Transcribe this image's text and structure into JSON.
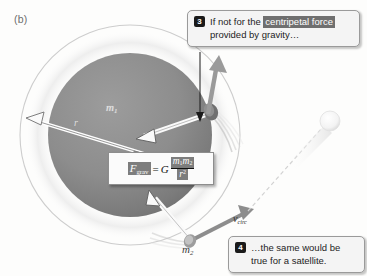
{
  "figure": {
    "panel_label": "(b)",
    "background_color": "#fdfdfc"
  },
  "callouts": [
    {
      "number": "3",
      "text_before": "If not for the ",
      "highlight": "centripetal force",
      "text_after": "provided by gravity…",
      "badge_color": "#1a1a1a",
      "highlight_color": "#6f6f6f"
    },
    {
      "number": "4",
      "text": "…the same would be true for a satellite.",
      "badge_color": "#1a1a1a"
    }
  ],
  "formula": {
    "lhs": "F",
    "lhs_sub": "grav",
    "equals": "=",
    "constant": "G",
    "numerator_m1": "m",
    "numerator_m1_sub": "1",
    "numerator_m2": "m",
    "numerator_m2_sub": "2",
    "denominator": "r",
    "denominator_exp": "2",
    "highlight_color": "#7d7d7d"
  },
  "labels": {
    "mass_primary": "m",
    "mass_primary_sub": "1",
    "mass_secondary": "m",
    "mass_secondary_sub": "2",
    "radius": "r",
    "velocity": "v",
    "velocity_sub": "circ"
  },
  "colors": {
    "sphere_fill": "#8a8a8a",
    "sphere_shadow": "#6a6a6a",
    "orbit_ring": "#c9c9c9",
    "halo": "#f0f0f0",
    "arrow_gray": "#8d8d8d",
    "arrow_white_fill": "#fafafa",
    "arrow_white_stroke": "#5d5d5d",
    "leader_line": "#1a1a1a",
    "satellite": "#f2f2f2"
  },
  "shapes": {
    "sphere_center_x": 130,
    "sphere_center_y": 135,
    "sphere_radius": 82,
    "orbit_radius": 110,
    "orbiting_mass_x": 210,
    "orbiting_mass_y": 112,
    "satellite_x": 329,
    "satellite_y": 121
  }
}
